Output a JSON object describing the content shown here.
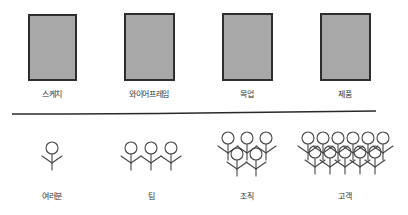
{
  "diagram": {
    "stages": [
      {
        "id": "sketch",
        "label": "스케치",
        "x": 28,
        "y": 14,
        "w": 49,
        "h": 67
      },
      {
        "id": "wireframe",
        "label": "와이어프레임",
        "x": 124,
        "y": 13,
        "w": 51,
        "h": 68
      },
      {
        "id": "mockup",
        "label": "목업",
        "x": 222,
        "y": 13,
        "w": 51,
        "h": 68
      },
      {
        "id": "product",
        "label": "제품",
        "x": 320,
        "y": 13,
        "w": 51,
        "h": 68
      }
    ],
    "audiences": [
      {
        "id": "you",
        "label": "여러분",
        "count": 1
      },
      {
        "id": "team",
        "label": "팀",
        "count": 3
      },
      {
        "id": "organization",
        "label": "조직",
        "count": 5
      },
      {
        "id": "customers",
        "label": "고객",
        "count": 11
      }
    ],
    "colors": {
      "frame_fill": "#a8a8a8",
      "frame_border": "#2e2e2e",
      "stroke": "#444444"
    }
  }
}
